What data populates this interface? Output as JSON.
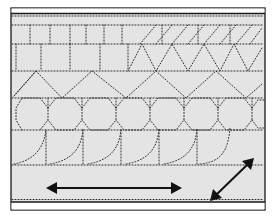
{
  "worksheet": {
    "type": "pre-writing tracing practice",
    "colors": {
      "page": "#ffffff",
      "panel": "#e4e4e4",
      "ink": "#1a1a1a",
      "dots": "#2a2a2a"
    },
    "rows": [
      {
        "name": "vertical-lines-and-slashes",
        "pattern": "vertical dotted strokes, then diagonal slashes"
      },
      {
        "name": "squares-and-triangles",
        "pattern": "dotted squares, then zigzag triangles"
      },
      {
        "name": "large-zigzag",
        "pattern": "wide dotted zigzag"
      },
      {
        "name": "octagon-chain",
        "pattern": "linked dotted octagons"
      },
      {
        "name": "hooked-curves",
        "pattern": "dotted hook curves with vertical strokes"
      }
    ],
    "arrows": [
      {
        "name": "horizontal-double-arrow",
        "direction": "left-right"
      },
      {
        "name": "diagonal-double-arrow",
        "direction": "down-left / up-right"
      }
    ]
  }
}
